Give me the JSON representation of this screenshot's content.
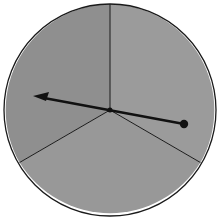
{
  "diagram": {
    "type": "spinner",
    "sections": 3,
    "colors": {
      "background": "#ffffff",
      "fill_left": "#8e8e8e",
      "fill_right": "#9a9a9a",
      "fill_bottom": "#979797",
      "stroke": "#1a1a1a"
    },
    "pointer": {
      "description": "arrow pivoting at center, pointing into left section"
    }
  }
}
